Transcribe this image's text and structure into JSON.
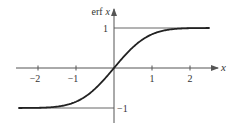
{
  "chart_data": {
    "type": "line",
    "title": "",
    "function": "erf x",
    "xlabel": "x",
    "ylabel": "erf x",
    "ylabel_parts": {
      "fn": "erf",
      "var": "x"
    },
    "x_ticks": [
      -2,
      -1,
      1,
      2
    ],
    "x_tick_labels": [
      "−2",
      "−1",
      "1",
      "2"
    ],
    "y_ticks": [
      1,
      -1
    ],
    "y_tick_labels": [
      "1",
      "−1"
    ],
    "asymptotes": [
      1,
      -1
    ],
    "xlim": [
      -2.5,
      2.5
    ],
    "ylim": [
      -1.35,
      1.45
    ],
    "grid": false,
    "legend": null,
    "series": [
      {
        "name": "erf x",
        "x": [
          -2.5,
          -2.0,
          -1.5,
          -1.0,
          -0.75,
          -0.5,
          -0.25,
          0,
          0.25,
          0.5,
          0.75,
          1.0,
          1.5,
          2.0,
          2.5
        ],
        "values": [
          -0.9996,
          -0.9953,
          -0.9661,
          -0.8427,
          -0.7112,
          -0.5205,
          -0.2763,
          0,
          0.2763,
          0.5205,
          0.7112,
          0.8427,
          0.9661,
          0.9953,
          0.9996
        ]
      }
    ],
    "colors": {
      "curve": "#222222",
      "axes": "#555555",
      "text": "#333333"
    }
  }
}
